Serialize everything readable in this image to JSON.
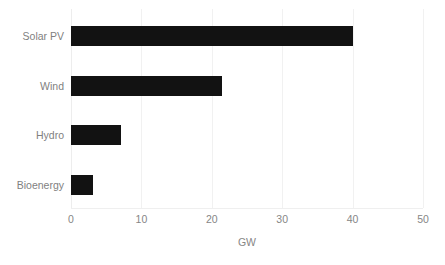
{
  "chart_data": {
    "type": "bar",
    "orientation": "horizontal",
    "title": "",
    "subtitle": "",
    "categories": [
      "Solar PV",
      "Wind",
      "Hydro",
      "Bioenergy"
    ],
    "values": [
      40.0,
      21.4,
      7.1,
      3.1
    ],
    "series": [
      {
        "name": "Capacity",
        "values": [
          40.0,
          21.4,
          7.1,
          3.1
        ]
      }
    ],
    "xlabel": "GW",
    "ylabel": "",
    "xlim": [
      0,
      50
    ],
    "xticks": [
      0,
      10,
      20,
      30,
      40,
      50
    ],
    "xtick_labels": [
      "0",
      "10",
      "20",
      "30",
      "40",
      "50"
    ],
    "grid": "vertical",
    "legend": false,
    "legend_position": "none",
    "bar_color": "#121212",
    "gridline_color": "#f1f1f1",
    "label_color": "#7f7f7f",
    "tick_color": "#868686",
    "background_color": "#ffffff"
  }
}
